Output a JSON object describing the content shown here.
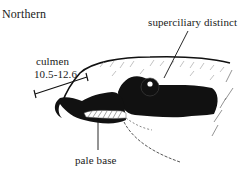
{
  "figure": {
    "title": "Northern",
    "labels": {
      "superciliary": "superciliary distinct",
      "culmen_name": "culmen",
      "culmen_range": "10.5-12.6",
      "pale_base": "pale base"
    },
    "colors": {
      "ink": "#111111",
      "paper": "#ffffff",
      "hatch": "#888888"
    }
  }
}
